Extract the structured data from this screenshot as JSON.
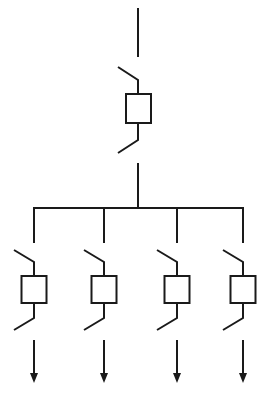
{
  "diagram": {
    "type": "single-line electrical distribution diagram",
    "stroke_color": "#1a1a1a",
    "background": "#ffffff",
    "incoming": {
      "supply_line": {
        "x": 138,
        "y1": 8,
        "y2": 57
      },
      "disconnector_top": {
        "x1": 118,
        "y1": 67,
        "x2": 138,
        "y2": 80
      },
      "breaker_box": {
        "x": 126,
        "y": 94,
        "w": 25,
        "h": 29
      },
      "disconnector_bottom": {
        "x1": 118,
        "y1": 153,
        "x2": 138,
        "y2": 140
      },
      "feed_line": {
        "x": 138,
        "y1": 163,
        "y2": 208
      }
    },
    "busbar": {
      "x1": 34,
      "x2": 243,
      "y": 208
    },
    "feeders": [
      {
        "id": "feeder-1",
        "x": 34,
        "icon": "arrow-down-icon"
      },
      {
        "id": "feeder-2",
        "x": 104,
        "icon": "arrow-down-icon"
      },
      {
        "id": "feeder-3",
        "x": 177,
        "icon": "arrow-down-icon"
      },
      {
        "id": "feeder-4",
        "x": 243,
        "icon": "arrow-down-icon"
      }
    ],
    "feeder_geometry": {
      "drop_y1": 208,
      "drop_y2": 243,
      "disc_top_y1": 250,
      "disc_top_y2": 262,
      "box_y": 276,
      "box_h": 27,
      "box_w": 25,
      "disc_bot_y1": 318,
      "disc_bot_y2": 330,
      "arrow_y1": 340,
      "arrow_y2": 383
    }
  }
}
